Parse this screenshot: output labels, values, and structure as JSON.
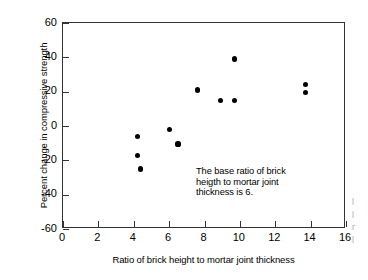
{
  "chart_data": {
    "type": "scatter",
    "title": "",
    "xlabel": "Ratio of brick height to mortar joint thickness",
    "ylabel": "Percent change in compressive strength",
    "xlim": [
      0,
      16
    ],
    "ylim": [
      -60,
      60
    ],
    "xticks": [
      0,
      2,
      4,
      6,
      8,
      10,
      12,
      14,
      16
    ],
    "yticks": [
      -60,
      -40,
      -20,
      0,
      20,
      40,
      60
    ],
    "xtick_labels": [
      "0",
      "2",
      "4",
      "6",
      "8",
      "10",
      "12",
      "14",
      "16"
    ],
    "ytick_labels": [
      "60",
      "40",
      "20",
      "0",
      "-20",
      "-40",
      "-60"
    ],
    "grid": false,
    "legend": null,
    "marker_color": "#000000",
    "marker_shape": "circle",
    "points": [
      {
        "x": 4.2,
        "y": -6.0
      },
      {
        "x": 4.2,
        "y": -17.0
      },
      {
        "x": 4.4,
        "y": -25.0
      },
      {
        "x": 6.0,
        "y": -2.0
      },
      {
        "x": 6.5,
        "y": -10.5
      },
      {
        "x": 7.6,
        "y": 21.0
      },
      {
        "x": 8.9,
        "y": 15.0
      },
      {
        "x": 9.7,
        "y": 39.0
      },
      {
        "x": 9.7,
        "y": 15.0
      },
      {
        "x": 13.7,
        "y": 24.0
      },
      {
        "x": 13.7,
        "y": 19.5
      }
    ],
    "annotations": [
      {
        "text": "The base ratio of brick\nheigth to mortar joint\nthickness is 6.",
        "x": 7.6,
        "y": -31
      }
    ]
  },
  "edge_artifact": {
    "lines": [
      "l",
      "l",
      "r",
      "l"
    ]
  }
}
